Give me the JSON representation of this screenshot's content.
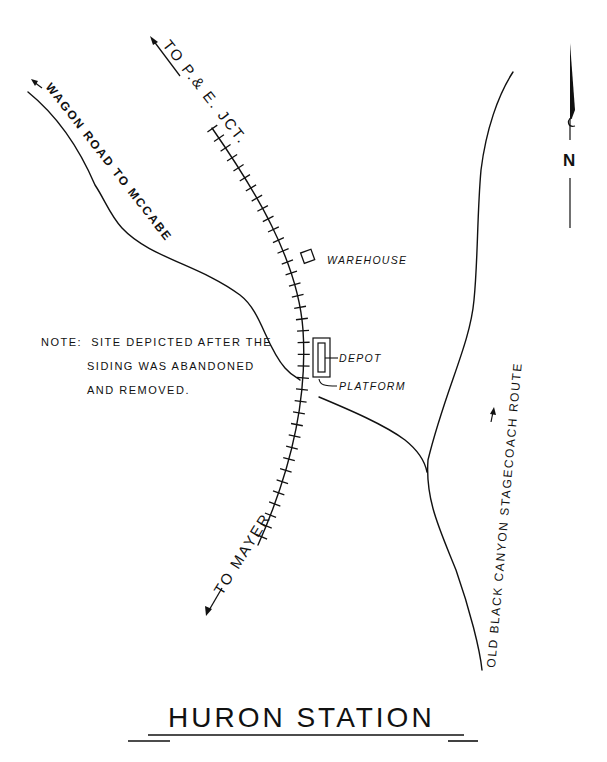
{
  "map": {
    "title": "HURON STATION",
    "north_label": "N",
    "note": {
      "line1": "NOTE:  SITE DEPICTED AFTER THE",
      "line2": "SIDING WAS ABANDONED",
      "line3": "AND REMOVED."
    },
    "rail_labels": {
      "north": "TO P.& E. JCT.",
      "south": "TO MAYER"
    },
    "roads": {
      "wagon_road": "WAGON ROAD TO MCCABE",
      "stagecoach": "OLD BLACK CANYON STAGECOACH ROUTE"
    },
    "structures": {
      "warehouse": "WAREHOUSE",
      "depot": "DEPOT",
      "platform": "PLATFORM"
    },
    "colors": {
      "ink": "#111111",
      "paper": "#ffffff"
    }
  }
}
